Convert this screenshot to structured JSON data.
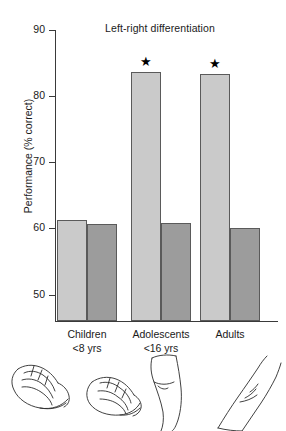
{
  "chart_data": {
    "type": "bar",
    "title": "Left-right differentiation",
    "xlabel": "",
    "ylabel": "Performance (% correct)",
    "ylim": [
      46,
      90
    ],
    "yticks": [
      50,
      60,
      70,
      80,
      90
    ],
    "ytick_labels": [
      "50",
      "60",
      "70",
      "80",
      "90"
    ],
    "grid": false,
    "legend": "none",
    "categories": [
      "Children",
      "Adolescents",
      "Adults"
    ],
    "category_sublabels": [
      "<8 yrs",
      "<16 yrs",
      ""
    ],
    "series": [
      {
        "name": "light-bar",
        "values": [
          61.2,
          83.6,
          83.4
        ]
      },
      {
        "name": "dark-bar",
        "values": [
          60.7,
          60.8,
          60.0
        ]
      }
    ],
    "annotations": [
      {
        "text": "★",
        "group": "Adolescents",
        "series": "light-bar"
      },
      {
        "text": "★",
        "group": "Adults",
        "series": "light-bar"
      }
    ],
    "colors": {
      "light": "#cacaca",
      "dark": "#9c9c9c",
      "outline": "#5a5a5a",
      "axis": "#3a3a3a"
    },
    "footer_illustration": "hand-arm-line-drawings"
  }
}
